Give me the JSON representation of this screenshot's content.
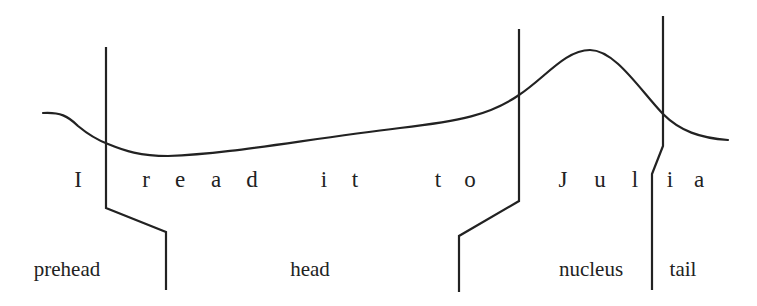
{
  "diagram": {
    "type": "intonation-contour",
    "sentence": "I read it to Julia",
    "letters": [
      {
        "ch": "I",
        "x": 78
      },
      {
        "ch": "r",
        "x": 146
      },
      {
        "ch": "e",
        "x": 180
      },
      {
        "ch": "a",
        "x": 216
      },
      {
        "ch": "d",
        "x": 252
      },
      {
        "ch": "i",
        "x": 324
      },
      {
        "ch": "t",
        "x": 355
      },
      {
        "ch": "t",
        "x": 438
      },
      {
        "ch": "o",
        "x": 470
      },
      {
        "ch": "J",
        "x": 563
      },
      {
        "ch": "u",
        "x": 600
      },
      {
        "ch": "l",
        "x": 635
      },
      {
        "ch": "i",
        "x": 670
      },
      {
        "ch": "a",
        "x": 699
      }
    ],
    "segments": [
      {
        "label": "prehead",
        "x": 67
      },
      {
        "label": "head",
        "x": 310
      },
      {
        "label": "nucleus",
        "x": 591
      },
      {
        "label": "tail",
        "x": 683
      }
    ],
    "colors": {
      "line": "#222222",
      "background": "#ffffff"
    }
  }
}
